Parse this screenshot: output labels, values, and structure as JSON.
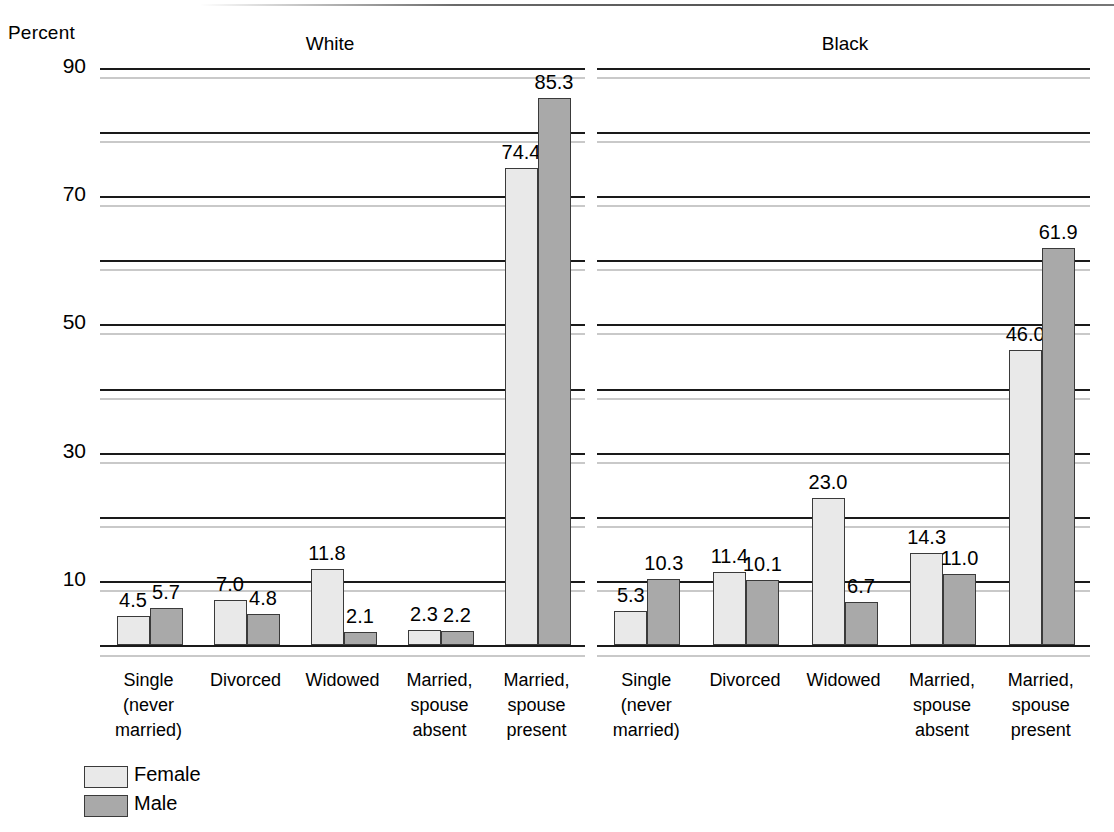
{
  "axis": {
    "y_title": "Percent",
    "ticks": [
      {
        "value": 90,
        "label": "90"
      },
      {
        "value": 80,
        "label": ""
      },
      {
        "value": 70,
        "label": "70"
      },
      {
        "value": 60,
        "label": ""
      },
      {
        "value": 50,
        "label": "50"
      },
      {
        "value": 40,
        "label": ""
      },
      {
        "value": 30,
        "label": "30"
      },
      {
        "value": 20,
        "label": ""
      },
      {
        "value": 10,
        "label": "10"
      }
    ]
  },
  "legend": {
    "items": [
      {
        "label": "Female",
        "color": "#e9e9e9"
      },
      {
        "label": "Male",
        "color": "#a9a9a9"
      }
    ]
  },
  "panels": [
    {
      "title": "White",
      "categories": [
        {
          "lines": [
            "Single",
            "(never",
            "married)"
          ]
        },
        {
          "lines": [
            "Divorced"
          ]
        },
        {
          "lines": [
            "Widowed"
          ]
        },
        {
          "lines": [
            "Married,",
            "spouse",
            "absent"
          ]
        },
        {
          "lines": [
            "Married,",
            "spouse",
            "present"
          ]
        }
      ],
      "female": [
        4.5,
        7.0,
        11.8,
        2.3,
        74.4
      ],
      "male": [
        5.7,
        4.8,
        2.1,
        2.2,
        85.3
      ],
      "female_labels": [
        "4.5",
        "7.0",
        "11.8",
        "2.3",
        "74.4"
      ],
      "male_labels": [
        "5.7",
        "4.8",
        "2.1",
        "2.2",
        "85.3"
      ]
    },
    {
      "title": "Black",
      "categories": [
        {
          "lines": [
            "Single",
            "(never",
            "married)"
          ]
        },
        {
          "lines": [
            "Divorced"
          ]
        },
        {
          "lines": [
            "Widowed"
          ]
        },
        {
          "lines": [
            "Married,",
            "spouse",
            "absent"
          ]
        },
        {
          "lines": [
            "Married,",
            "spouse",
            "present"
          ]
        }
      ],
      "female": [
        5.3,
        11.4,
        23.0,
        14.3,
        46.0
      ],
      "male": [
        10.3,
        10.1,
        6.7,
        11.0,
        61.9
      ],
      "female_labels": [
        "5.3",
        "11.4",
        "23.0",
        "14.3",
        "46.0"
      ],
      "male_labels": [
        "10.3",
        "10.1",
        "6.7",
        "11.0",
        "61.9"
      ]
    }
  ],
  "chart_data": {
    "type": "bar",
    "title": "",
    "xlabel": "",
    "ylabel": "Percent",
    "ylim": [
      0,
      90
    ],
    "yticks": [
      10,
      20,
      30,
      40,
      50,
      60,
      70,
      80,
      90
    ],
    "ytick_labels": [
      "10",
      "",
      "30",
      "",
      "50",
      "",
      "70",
      "",
      "90"
    ],
    "grid": true,
    "legend_position": "bottom-left",
    "panels": [
      "White",
      "Black"
    ],
    "categories": [
      "Single (never married)",
      "Divorced",
      "Widowed",
      "Married, spouse absent",
      "Married, spouse present"
    ],
    "series": [
      {
        "name": "Female",
        "panel": "White",
        "values": [
          4.5,
          7.0,
          11.8,
          2.3,
          74.4
        ],
        "color": "#e9e9e9"
      },
      {
        "name": "Male",
        "panel": "White",
        "values": [
          5.7,
          4.8,
          2.1,
          2.2,
          85.3
        ],
        "color": "#a9a9a9"
      },
      {
        "name": "Female",
        "panel": "Black",
        "values": [
          5.3,
          11.4,
          23.0,
          14.3,
          46.0
        ],
        "color": "#e9e9e9"
      },
      {
        "name": "Male",
        "panel": "Black",
        "values": [
          10.3,
          10.1,
          6.7,
          11.0,
          61.9
        ],
        "color": "#a9a9a9"
      }
    ]
  }
}
